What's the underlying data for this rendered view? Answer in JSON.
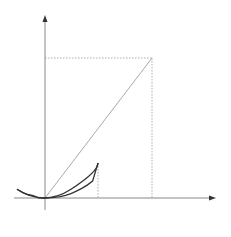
{
  "diagram": {
    "curve_label": "y=x²",
    "axis_x_label": "x",
    "axis_y_label": "y",
    "origin_label": "O",
    "point_A_label": "A",
    "tick_c_label": "c",
    "tick_a_label": "a",
    "tick_a2_label": "a²",
    "elements": [
      {
        "type": "parabola",
        "equation": "y = x^2"
      },
      {
        "type": "chord",
        "from": "O",
        "to": "A"
      },
      {
        "type": "tangent_line",
        "at": "c",
        "parallel_to": "OA"
      },
      {
        "type": "dotted_guide",
        "from": "A",
        "to": "x-axis at a"
      },
      {
        "type": "dotted_guide",
        "from": "A",
        "to": "y-axis at a²"
      },
      {
        "type": "dotted_guide",
        "from": "tangent point",
        "to": "x-axis at c"
      }
    ],
    "colors": {
      "curve": "#333333",
      "tangent": "#444444",
      "chord": "#aaaaaa",
      "axes": "#777777",
      "guides": "#999999"
    }
  }
}
